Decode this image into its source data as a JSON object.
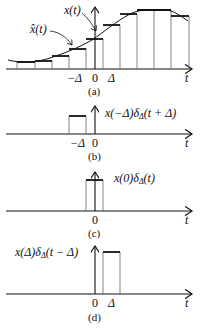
{
  "panels": [
    {
      "id": "a",
      "caption": "(a)",
      "labels": {
        "signal": "x(t)",
        "approx": "x̂(t)",
        "tick_neg": "−Δ",
        "tick_zero": "0",
        "tick_pos": "Δ",
        "axis": "t"
      }
    },
    {
      "id": "b",
      "caption": "(b)",
      "labels": {
        "pulse": "x(−Δ)δΔ(t + Δ)",
        "tick_neg": "−Δ",
        "tick_zero": "0",
        "axis": "t"
      }
    },
    {
      "id": "c",
      "caption": "(c)",
      "labels": {
        "pulse": "x(0)δΔ(t)",
        "tick_zero": "0",
        "axis": "t"
      }
    },
    {
      "id": "d",
      "caption": "(d)",
      "labels": {
        "pulse": "x(Δ)δΔ(t − Δ)",
        "tick_zero": "0",
        "tick_pos": "Δ",
        "axis": "t"
      }
    }
  ],
  "colors": {
    "ink": "#111111",
    "stairs": "#555555"
  }
}
